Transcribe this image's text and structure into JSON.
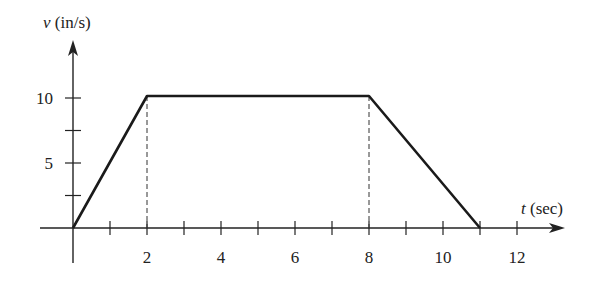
{
  "chart_data": {
    "type": "line",
    "title": "",
    "xlabel": "t (sec)",
    "xlabel_var": "t",
    "xlabel_unit": "(sec)",
    "ylabel": "v (in/s)",
    "ylabel_var": "v",
    "ylabel_unit": "(in/s)",
    "x": [
      0,
      2,
      8,
      11
    ],
    "y": [
      0,
      10,
      10,
      0
    ],
    "series": [
      {
        "name": "velocity",
        "x": [
          0,
          2,
          8,
          11
        ],
        "y": [
          0,
          10,
          10,
          0
        ]
      }
    ],
    "xlim": [
      -0.9,
      13.2
    ],
    "ylim": [
      -2.7,
      14.4
    ],
    "x_ticks": [
      1,
      2,
      3,
      4,
      5,
      6,
      7,
      8,
      9,
      10,
      11,
      12
    ],
    "x_tick_labels": [
      {
        "value": 2,
        "label": "2"
      },
      {
        "value": 4,
        "label": "4"
      },
      {
        "value": 6,
        "label": "6"
      },
      {
        "value": 8,
        "label": "8"
      },
      {
        "value": 10,
        "label": "10"
      },
      {
        "value": 12,
        "label": "12"
      }
    ],
    "y_ticks": [
      2.5,
      5,
      7.5,
      10
    ],
    "y_tick_labels": [
      {
        "value": 5,
        "label": "5"
      },
      {
        "value": 10,
        "label": "10"
      }
    ],
    "dashed_guides": [
      2,
      8
    ],
    "grid": false,
    "legend": null
  },
  "layout": {
    "origin_px": [
      73,
      228
    ],
    "px_per_x": 37,
    "px_per_y": 13,
    "x_axis_start_px": 40,
    "x_axis_end_px": 565,
    "y_axis_top_px": 40,
    "y_axis_bottom_px": 263,
    "line_color": "#1a1a1a",
    "axis_color": "#222222"
  }
}
